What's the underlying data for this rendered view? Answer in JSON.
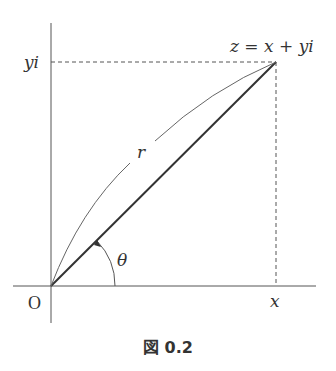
{
  "figure": {
    "caption": "図 0.2",
    "labels": {
      "point": "z = x + yi",
      "y_tick": "yi",
      "x_tick": "x",
      "origin": "O",
      "radius": "r",
      "angle": "θ"
    },
    "colors": {
      "line": "#333333",
      "thin_line": "#666666"
    }
  }
}
